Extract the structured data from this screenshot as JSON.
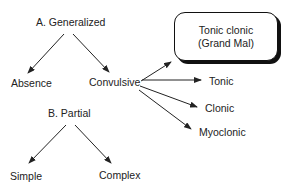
{
  "diagram": {
    "type": "classification-tree",
    "colors": {
      "line": "#222222",
      "text": "#222222",
      "box_border": "#111111",
      "background": "#ffffff"
    },
    "nodes": {
      "generalized": "A. Generalized",
      "absence": "Absence",
      "convulsive": "Convulsive",
      "tonic_clonic_line1": "Tonic clonic",
      "tonic_clonic_line2": "(Grand Mal)",
      "tonic": "Tonic",
      "clonic": "Clonic",
      "myoclonic": "Myoclonic",
      "partial": "B. Partial",
      "simple": "Simple",
      "complex": "Complex"
    },
    "edges": [
      {
        "from": "A. Generalized",
        "to": "Absence"
      },
      {
        "from": "A. Generalized",
        "to": "Convulsive"
      },
      {
        "from": "Convulsive",
        "to": "Tonic clonic (Grand Mal)"
      },
      {
        "from": "Convulsive",
        "to": "Tonic"
      },
      {
        "from": "Convulsive",
        "to": "Clonic"
      },
      {
        "from": "Convulsive",
        "to": "Myoclonic"
      },
      {
        "from": "B. Partial",
        "to": "Simple"
      },
      {
        "from": "B. Partial",
        "to": "Complex"
      }
    ]
  }
}
